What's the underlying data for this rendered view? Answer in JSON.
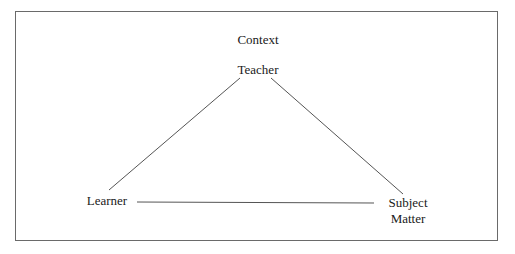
{
  "diagram": {
    "type": "didactic-triangle",
    "context_label": "Context",
    "nodes": {
      "teacher": "Teacher",
      "learner": "Learner",
      "subject_line1": "Subject",
      "subject_line2": "Matter"
    },
    "edges": [
      {
        "from": "Teacher",
        "to": "Learner"
      },
      {
        "from": "Teacher",
        "to": "Subject Matter"
      },
      {
        "from": "Learner",
        "to": "Subject Matter"
      }
    ],
    "line_color": "#555555",
    "frame_color": "#6a6a6a"
  }
}
